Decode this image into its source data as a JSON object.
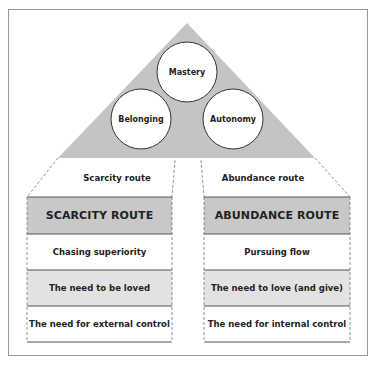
{
  "pyramid": {
    "top": "Mastery",
    "left": "Belonging",
    "right": "Autonomy"
  },
  "scarcity": {
    "route_label": "Scarcity route",
    "header": "SCARCITY ROUTE",
    "rows": [
      "Chasing superiority",
      "The need to be loved",
      "The need for external control"
    ]
  },
  "abundance": {
    "route_label": "Abundance route",
    "header": "ABUNDANCE ROUTE",
    "rows": [
      "Pursuing flow",
      "The need to love (and give)",
      "The need for internal control"
    ]
  },
  "colors": {
    "triangle_fill": "#c4c4c4",
    "header_fill": "#c8c8c8",
    "light_row_fill": "#e2e2e2",
    "line": "#555555",
    "frame": "#9a9a9a"
  }
}
